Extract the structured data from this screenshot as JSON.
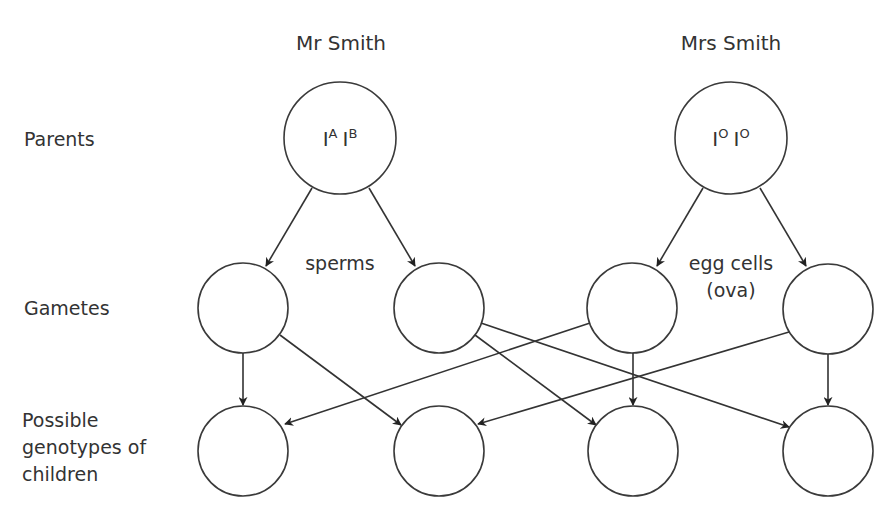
{
  "parents": {
    "father": {
      "name": "Mr Smith",
      "genotype": {
        "allele1": "I",
        "sup1": "A",
        "allele2": "I",
        "sup2": "B"
      }
    },
    "mother": {
      "name": "Mrs Smith",
      "genotype": {
        "allele1": "I",
        "sup1": "O",
        "allele2": "I",
        "sup2": "O"
      }
    }
  },
  "row_labels": {
    "parents": "Parents",
    "gametes": "Gametes",
    "children": [
      "Possible",
      "genotypes of",
      "children"
    ]
  },
  "gamete_labels": {
    "sperms": "sperms",
    "eggs": [
      "egg cells",
      "(ova)"
    ]
  },
  "gametes": [
    {
      "id": "sperm-1",
      "value": ""
    },
    {
      "id": "sperm-2",
      "value": ""
    },
    {
      "id": "egg-1",
      "value": ""
    },
    {
      "id": "egg-2",
      "value": ""
    }
  ],
  "children": [
    {
      "id": "child-1",
      "value": ""
    },
    {
      "id": "child-2",
      "value": ""
    },
    {
      "id": "child-3",
      "value": ""
    },
    {
      "id": "child-4",
      "value": ""
    }
  ],
  "colors": {
    "stroke": "#333333",
    "text": "#333333",
    "background": "#ffffff"
  }
}
